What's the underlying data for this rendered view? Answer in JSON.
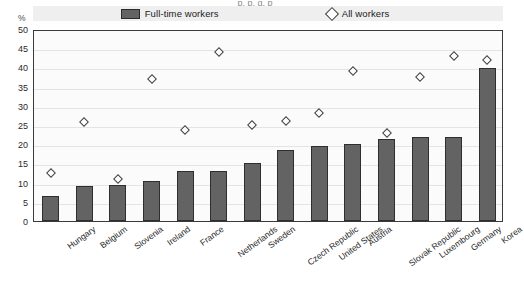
{
  "title_sliver": "p, p, g, p",
  "axis": {
    "y_unit": "%",
    "y_ticks": [
      0,
      5,
      10,
      15,
      20,
      25,
      30,
      35,
      40,
      45,
      50
    ]
  },
  "legend": {
    "items": [
      {
        "label": "Full-time workers",
        "marker": "bar-swatch",
        "color": "#636363"
      },
      {
        "label": "All workers",
        "marker": "diamond-swatch",
        "color": "#ffffff"
      }
    ]
  },
  "chart_data": {
    "type": "bar",
    "title": "",
    "xlabel": "",
    "ylabel": "%",
    "ylim": [
      0,
      50
    ],
    "ytick_step": 5,
    "grid": true,
    "legend_position": "top-center",
    "categories": [
      "Hungary",
      "Belgium",
      "Slovenia",
      "Ireland",
      "France",
      "Netherlands",
      "Sweden",
      "Czech Republic",
      "United States",
      "Austria",
      "Slovak Republic",
      "Luxembourg",
      "Germany",
      "Korea"
    ],
    "series": [
      {
        "name": "Full-time workers",
        "type": "bar",
        "color": "#636363",
        "values": [
          6.5,
          9.0,
          9.5,
          10.3,
          13.0,
          13.0,
          15.0,
          18.5,
          19.5,
          20.0,
          21.3,
          22.0,
          22.0,
          39.8
        ]
      },
      {
        "name": "All workers",
        "type": "scatter",
        "marker": "diamond",
        "color": "#ffffff",
        "values": [
          12.5,
          25.7,
          11.0,
          37.0,
          23.8,
          44.0,
          25.0,
          26.0,
          28.0,
          39.0,
          23.0,
          37.5,
          43.0,
          42.0
        ]
      }
    ]
  }
}
